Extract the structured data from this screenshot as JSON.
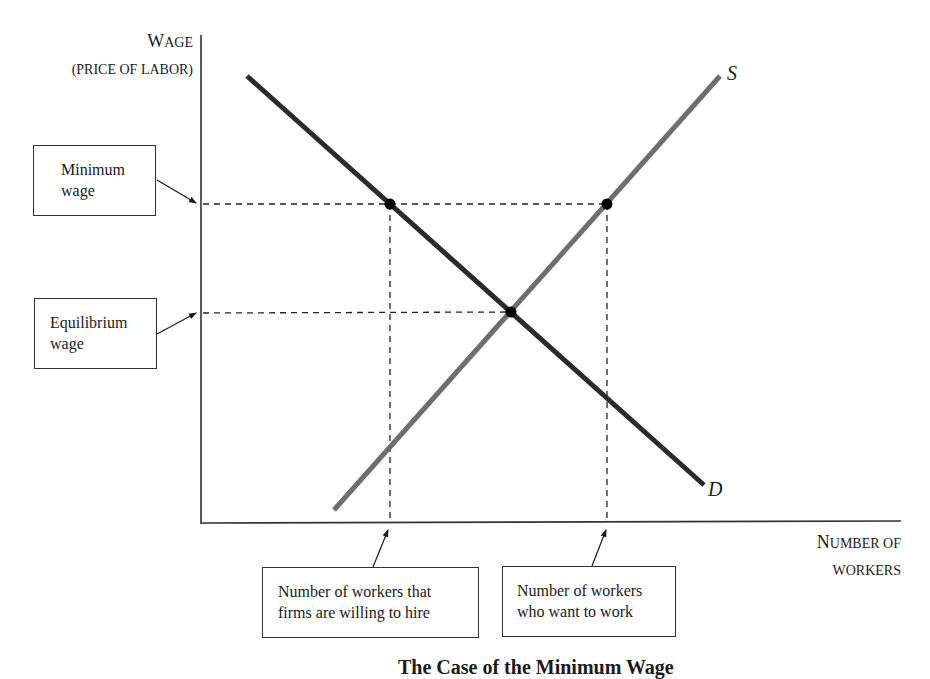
{
  "diagram": {
    "type": "supply-demand",
    "caption": "The Case of the Minimum Wage",
    "y_axis": {
      "label_line1_first": "W",
      "label_line1_rest": "AGE",
      "label_line2": "(PRICE OF LABOR)"
    },
    "x_axis": {
      "label_line1_first": "N",
      "label_line1_rest": "UMBER OF",
      "label_line2": "WORKERS"
    },
    "curves": {
      "supply": {
        "label": "S",
        "color": "#6e6e6e",
        "from": [
          334,
          510
        ],
        "to": [
          720,
          76
        ]
      },
      "demand": {
        "label": "D",
        "color": "#2b2b2b",
        "from": [
          247,
          76
        ],
        "to": [
          704,
          485
        ]
      }
    },
    "points": {
      "min_wage_demand": [
        390,
        204
      ],
      "min_wage_supply": [
        607,
        204
      ],
      "equilibrium": [
        511,
        312
      ]
    },
    "callouts": {
      "minimum_wage": {
        "line1": "Minimum",
        "line2": "wage"
      },
      "equilibrium_wage": {
        "line1": "Equilibrium",
        "line2": "wage"
      },
      "firms_hire": {
        "line1": "Number of workers that",
        "line2": "firms are willing to hire"
      },
      "want_work": {
        "line1": "Number of workers",
        "line2": "who want to work"
      }
    }
  }
}
